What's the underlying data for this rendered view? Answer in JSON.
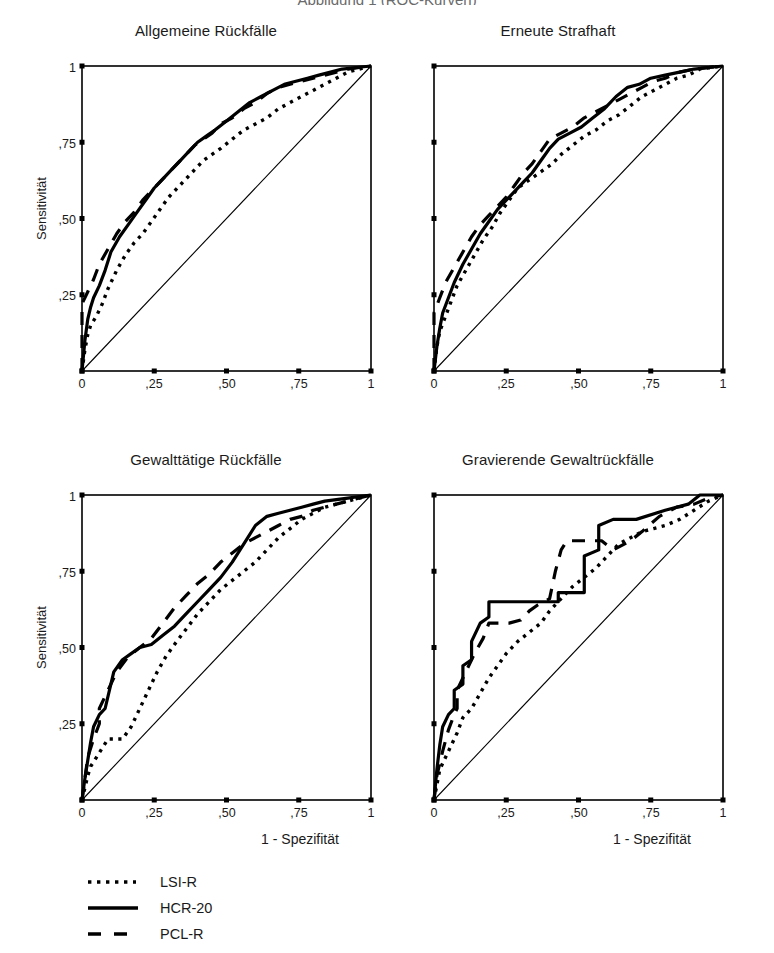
{
  "figure": {
    "top_title_clipped": "Abbildung 1 (ROC-Kurven)",
    "shared_xlabel": "1 - Spezifität",
    "shared_ylabel": "Sensitivität",
    "x_ticks": [
      "0",
      ",25",
      ",50",
      ",75",
      "1"
    ],
    "y_ticks": [
      "1",
      ",75",
      ",50",
      ",25"
    ],
    "x_tick_values": [
      0,
      0.25,
      0.5,
      0.75,
      1
    ],
    "y_tick_values": [
      1,
      0.75,
      0.5,
      0.25
    ],
    "line_color": "#000000",
    "frame_color": "#000000"
  },
  "legend": {
    "items": [
      {
        "label": "LSI-R",
        "style": "dotted"
      },
      {
        "label": "HCR-20",
        "style": "solid"
      },
      {
        "label": "PCL-R",
        "style": "dashed"
      }
    ]
  },
  "chart_data": [
    {
      "type": "line",
      "title": "Allgemeine Rückfälle",
      "xlabel": "1 - Spezifität",
      "ylabel": "Sensitivität",
      "xlim": [
        0,
        1
      ],
      "ylim": [
        0,
        1
      ],
      "grid": false,
      "reference_line": {
        "name": "Zufallslinie",
        "x": [
          0,
          1
        ],
        "y": [
          0,
          1
        ]
      },
      "series": [
        {
          "name": "LSI-R",
          "style": "dotted",
          "x": [
            0.0,
            0.01,
            0.02,
            0.03,
            0.05,
            0.07,
            0.09,
            0.12,
            0.15,
            0.18,
            0.21,
            0.24,
            0.27,
            0.3,
            0.33,
            0.36,
            0.39,
            0.42,
            0.45,
            0.48,
            0.52,
            0.56,
            0.6,
            0.64,
            0.68,
            0.72,
            0.76,
            0.8,
            0.84,
            0.88,
            0.92,
            0.96,
            1.0
          ],
          "y": [
            0.0,
            0.07,
            0.12,
            0.15,
            0.18,
            0.22,
            0.27,
            0.33,
            0.38,
            0.42,
            0.45,
            0.49,
            0.53,
            0.57,
            0.6,
            0.63,
            0.66,
            0.69,
            0.71,
            0.73,
            0.76,
            0.79,
            0.81,
            0.83,
            0.86,
            0.88,
            0.9,
            0.92,
            0.94,
            0.96,
            0.98,
            0.99,
            1.0
          ]
        },
        {
          "name": "HCR-20",
          "style": "solid",
          "x": [
            0.0,
            0.01,
            0.02,
            0.03,
            0.04,
            0.06,
            0.08,
            0.1,
            0.13,
            0.16,
            0.19,
            0.22,
            0.25,
            0.28,
            0.31,
            0.34,
            0.37,
            0.4,
            0.43,
            0.46,
            0.5,
            0.54,
            0.58,
            0.62,
            0.66,
            0.7,
            0.74,
            0.78,
            0.82,
            0.86,
            0.9,
            0.95,
            1.0
          ],
          "y": [
            0.0,
            0.1,
            0.17,
            0.21,
            0.24,
            0.28,
            0.33,
            0.39,
            0.44,
            0.48,
            0.52,
            0.56,
            0.6,
            0.63,
            0.66,
            0.69,
            0.72,
            0.75,
            0.77,
            0.79,
            0.82,
            0.85,
            0.88,
            0.9,
            0.92,
            0.94,
            0.95,
            0.96,
            0.97,
            0.98,
            0.99,
            0.995,
            1.0
          ]
        },
        {
          "name": "PCL-R",
          "style": "dashed",
          "x": [
            0.0,
            0.0,
            0.02,
            0.04,
            0.06,
            0.09,
            0.12,
            0.15,
            0.18,
            0.21,
            0.24,
            0.27,
            0.3,
            0.33,
            0.36,
            0.39,
            0.42,
            0.45,
            0.48,
            0.52,
            0.56,
            0.6,
            0.64,
            0.68,
            0.72,
            0.76,
            0.8,
            0.84,
            0.88,
            0.92,
            0.96,
            1.0
          ],
          "y": [
            0.0,
            0.22,
            0.26,
            0.3,
            0.35,
            0.4,
            0.45,
            0.49,
            0.52,
            0.56,
            0.59,
            0.62,
            0.65,
            0.68,
            0.71,
            0.74,
            0.76,
            0.78,
            0.81,
            0.83,
            0.86,
            0.88,
            0.91,
            0.93,
            0.94,
            0.95,
            0.96,
            0.97,
            0.98,
            0.99,
            0.995,
            1.0
          ]
        }
      ]
    },
    {
      "type": "line",
      "title": "Erneute Strafhaft",
      "xlabel": "1 - Spezifität",
      "ylabel": "Sensitivität",
      "xlim": [
        0,
        1
      ],
      "ylim": [
        0,
        1
      ],
      "grid": false,
      "reference_line": {
        "name": "Zufallslinie",
        "x": [
          0,
          1
        ],
        "y": [
          0,
          1
        ]
      },
      "series": [
        {
          "name": "LSI-R",
          "style": "dotted",
          "x": [
            0.0,
            0.01,
            0.02,
            0.04,
            0.06,
            0.08,
            0.11,
            0.14,
            0.17,
            0.2,
            0.23,
            0.26,
            0.29,
            0.32,
            0.35,
            0.38,
            0.41,
            0.44,
            0.48,
            0.52,
            0.56,
            0.6,
            0.64,
            0.68,
            0.72,
            0.76,
            0.8,
            0.84,
            0.88,
            0.92,
            0.96,
            1.0
          ],
          "y": [
            0.0,
            0.08,
            0.13,
            0.18,
            0.23,
            0.28,
            0.33,
            0.38,
            0.43,
            0.47,
            0.52,
            0.56,
            0.6,
            0.62,
            0.64,
            0.66,
            0.68,
            0.71,
            0.74,
            0.77,
            0.79,
            0.82,
            0.84,
            0.87,
            0.9,
            0.92,
            0.94,
            0.96,
            0.97,
            0.99,
            0.995,
            1.0
          ]
        },
        {
          "name": "HCR-20",
          "style": "solid",
          "x": [
            0.0,
            0.01,
            0.02,
            0.03,
            0.05,
            0.07,
            0.1,
            0.13,
            0.16,
            0.19,
            0.22,
            0.25,
            0.28,
            0.31,
            0.34,
            0.37,
            0.4,
            0.43,
            0.47,
            0.51,
            0.55,
            0.59,
            0.63,
            0.67,
            0.71,
            0.75,
            0.8,
            0.85,
            0.9,
            0.95,
            1.0
          ],
          "y": [
            0.0,
            0.08,
            0.14,
            0.19,
            0.24,
            0.29,
            0.35,
            0.4,
            0.45,
            0.49,
            0.53,
            0.56,
            0.59,
            0.62,
            0.65,
            0.69,
            0.73,
            0.76,
            0.78,
            0.8,
            0.83,
            0.86,
            0.9,
            0.93,
            0.94,
            0.96,
            0.97,
            0.98,
            0.99,
            0.995,
            1.0
          ]
        },
        {
          "name": "PCL-R",
          "style": "dashed",
          "x": [
            0.0,
            0.0,
            0.02,
            0.04,
            0.07,
            0.1,
            0.13,
            0.16,
            0.19,
            0.22,
            0.25,
            0.28,
            0.31,
            0.34,
            0.37,
            0.4,
            0.44,
            0.48,
            0.52,
            0.56,
            0.6,
            0.64,
            0.68,
            0.72,
            0.76,
            0.8,
            0.85,
            0.9,
            0.95,
            1.0
          ],
          "y": [
            0.0,
            0.19,
            0.24,
            0.29,
            0.34,
            0.39,
            0.44,
            0.48,
            0.51,
            0.54,
            0.57,
            0.61,
            0.65,
            0.68,
            0.72,
            0.76,
            0.78,
            0.8,
            0.83,
            0.85,
            0.87,
            0.89,
            0.91,
            0.93,
            0.95,
            0.96,
            0.98,
            0.99,
            0.995,
            1.0
          ]
        }
      ]
    },
    {
      "type": "line",
      "title": "Gewalttätige Rückfälle",
      "xlabel": "1 - Spezifität",
      "ylabel": "Sensitivität",
      "xlim": [
        0,
        1
      ],
      "ylim": [
        0,
        1
      ],
      "grid": false,
      "reference_line": {
        "name": "Zufallslinie",
        "x": [
          0,
          1
        ],
        "y": [
          0,
          1
        ]
      },
      "series": [
        {
          "name": "LSI-R",
          "style": "dotted",
          "x": [
            0.0,
            0.01,
            0.02,
            0.03,
            0.05,
            0.07,
            0.09,
            0.11,
            0.14,
            0.17,
            0.2,
            0.23,
            0.26,
            0.29,
            0.32,
            0.36,
            0.4,
            0.44,
            0.48,
            0.52,
            0.56,
            0.6,
            0.64,
            0.68,
            0.72,
            0.76,
            0.8,
            0.84,
            0.88,
            0.92,
            0.96,
            1.0
          ],
          "y": [
            0.0,
            0.04,
            0.08,
            0.11,
            0.14,
            0.17,
            0.2,
            0.2,
            0.2,
            0.24,
            0.3,
            0.36,
            0.42,
            0.47,
            0.51,
            0.56,
            0.61,
            0.65,
            0.69,
            0.72,
            0.75,
            0.78,
            0.82,
            0.86,
            0.89,
            0.92,
            0.94,
            0.96,
            0.97,
            0.98,
            0.99,
            1.0
          ]
        },
        {
          "name": "HCR-20",
          "style": "solid",
          "x": [
            0.0,
            0.01,
            0.02,
            0.03,
            0.04,
            0.06,
            0.08,
            0.11,
            0.14,
            0.17,
            0.2,
            0.24,
            0.28,
            0.32,
            0.36,
            0.4,
            0.44,
            0.48,
            0.52,
            0.56,
            0.6,
            0.64,
            0.68,
            0.72,
            0.76,
            0.8,
            0.84,
            0.88,
            0.92,
            0.96,
            1.0
          ],
          "y": [
            0.0,
            0.07,
            0.13,
            0.19,
            0.24,
            0.28,
            0.3,
            0.42,
            0.46,
            0.48,
            0.5,
            0.51,
            0.54,
            0.57,
            0.61,
            0.65,
            0.69,
            0.73,
            0.78,
            0.84,
            0.9,
            0.93,
            0.94,
            0.95,
            0.96,
            0.97,
            0.98,
            0.985,
            0.99,
            0.995,
            1.0
          ]
        },
        {
          "name": "PCL-R",
          "style": "dashed",
          "x": [
            0.0,
            0.01,
            0.02,
            0.04,
            0.06,
            0.06,
            0.09,
            0.12,
            0.16,
            0.2,
            0.24,
            0.28,
            0.32,
            0.36,
            0.4,
            0.44,
            0.48,
            0.52,
            0.56,
            0.6,
            0.64,
            0.68,
            0.72,
            0.76,
            0.8,
            0.84,
            0.88,
            0.92,
            0.96,
            1.0
          ],
          "y": [
            0.0,
            0.07,
            0.14,
            0.2,
            0.25,
            0.3,
            0.36,
            0.42,
            0.47,
            0.5,
            0.53,
            0.58,
            0.63,
            0.67,
            0.71,
            0.74,
            0.78,
            0.81,
            0.84,
            0.86,
            0.88,
            0.9,
            0.92,
            0.93,
            0.95,
            0.96,
            0.97,
            0.98,
            0.99,
            1.0
          ]
        }
      ]
    },
    {
      "type": "line",
      "title": "Gravierende Gewaltrückfälle",
      "xlabel": "1 - Spezifität",
      "ylabel": "Sensitivität",
      "xlim": [
        0,
        1
      ],
      "ylim": [
        0,
        1
      ],
      "grid": false,
      "reference_line": {
        "name": "Zufallslinie",
        "x": [
          0,
          1
        ],
        "y": [
          0,
          1
        ]
      },
      "series": [
        {
          "name": "LSI-R",
          "style": "dotted",
          "x": [
            0.0,
            0.01,
            0.02,
            0.04,
            0.06,
            0.08,
            0.1,
            0.13,
            0.16,
            0.19,
            0.22,
            0.25,
            0.29,
            0.33,
            0.37,
            0.4,
            0.44,
            0.48,
            0.52,
            0.56,
            0.6,
            0.64,
            0.68,
            0.72,
            0.76,
            0.8,
            0.85,
            0.9,
            0.95,
            1.0
          ],
          "y": [
            0.0,
            0.05,
            0.1,
            0.14,
            0.18,
            0.22,
            0.27,
            0.3,
            0.35,
            0.4,
            0.44,
            0.48,
            0.52,
            0.55,
            0.58,
            0.62,
            0.66,
            0.7,
            0.73,
            0.76,
            0.8,
            0.84,
            0.86,
            0.88,
            0.89,
            0.9,
            0.92,
            0.95,
            0.98,
            1.0
          ]
        },
        {
          "name": "HCR-20",
          "style": "solid",
          "x": [
            0.0,
            0.01,
            0.02,
            0.03,
            0.05,
            0.07,
            0.07,
            0.1,
            0.1,
            0.13,
            0.13,
            0.16,
            0.19,
            0.19,
            0.4,
            0.43,
            0.43,
            0.52,
            0.52,
            0.57,
            0.57,
            0.62,
            0.7,
            0.8,
            0.88,
            0.92,
            0.96,
            1.0
          ],
          "y": [
            0.0,
            0.1,
            0.18,
            0.24,
            0.28,
            0.3,
            0.36,
            0.38,
            0.44,
            0.46,
            0.52,
            0.58,
            0.6,
            0.65,
            0.65,
            0.65,
            0.68,
            0.68,
            0.8,
            0.82,
            0.9,
            0.92,
            0.92,
            0.95,
            0.97,
            1.0,
            1.0,
            1.0
          ]
        },
        {
          "name": "PCL-R",
          "style": "dashed",
          "x": [
            0.0,
            0.01,
            0.03,
            0.05,
            0.07,
            0.08,
            0.08,
            0.11,
            0.14,
            0.17,
            0.19,
            0.22,
            0.26,
            0.3,
            0.33,
            0.36,
            0.4,
            0.42,
            0.44,
            0.46,
            0.52,
            0.58,
            0.62,
            0.68,
            0.72,
            0.78,
            0.84,
            0.9,
            0.95,
            1.0
          ],
          "y": [
            0.0,
            0.08,
            0.16,
            0.23,
            0.28,
            0.3,
            0.36,
            0.42,
            0.48,
            0.53,
            0.58,
            0.58,
            0.58,
            0.59,
            0.62,
            0.64,
            0.66,
            0.75,
            0.82,
            0.85,
            0.85,
            0.85,
            0.82,
            0.85,
            0.88,
            0.93,
            0.96,
            0.97,
            0.99,
            1.0
          ]
        }
      ]
    }
  ]
}
